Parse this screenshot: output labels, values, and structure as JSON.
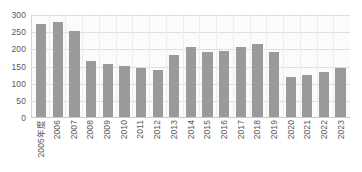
{
  "chart_data": {
    "type": "bar",
    "title": "",
    "xlabel": "",
    "ylabel": "",
    "ylim": [
      0,
      300
    ],
    "yticks": [
      300,
      250,
      200,
      150,
      100,
      50,
      0
    ],
    "grid": true,
    "legend": "none",
    "bar_color": "#9a9a9a",
    "plot_background": "#fbfbfb",
    "gridline_color": "#dedede",
    "categories": [
      "2005年度",
      "2006",
      "2007",
      "2008",
      "2009",
      "2010",
      "2011",
      "2012",
      "2013",
      "2014",
      "2015",
      "2016",
      "2017",
      "2018",
      "2019",
      "2020",
      "2021",
      "2022",
      "2023"
    ],
    "values": [
      270,
      278,
      250,
      163,
      153,
      149,
      143,
      137,
      180,
      205,
      188,
      192,
      204,
      212,
      190,
      116,
      122,
      130,
      143
    ]
  }
}
